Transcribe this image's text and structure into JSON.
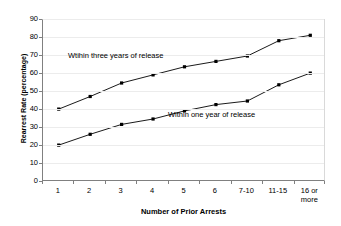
{
  "chart_data": {
    "type": "line",
    "title": "",
    "xlabel": "Number of Prior Arrests",
    "ylabel": "Rearrest Rate (percentage)",
    "categories": [
      "1",
      "2",
      "3",
      "4",
      "5",
      "6",
      "7-10",
      "11-15",
      "16 or\nmore"
    ],
    "ylim": [
      0,
      90
    ],
    "ytick_labels": [
      "90",
      "80",
      "70",
      "60",
      "50",
      "40",
      "30",
      "20",
      "10",
      "0"
    ],
    "ytick_values": [
      90,
      80,
      70,
      60,
      50,
      40,
      30,
      20,
      10,
      0
    ],
    "grid": true,
    "grid_axis": "y",
    "legend": "none",
    "marker": "square",
    "marker_color": "#000000",
    "line_color": "#000000",
    "series": [
      {
        "name": "Wtihin three years of release",
        "values": [
          40.5,
          47.5,
          55,
          59.5,
          64,
          67,
          70,
          78.5,
          81.5
        ]
      },
      {
        "name": "Within one year of release",
        "values": [
          20.5,
          26.5,
          32,
          35,
          39.5,
          43,
          45,
          54,
          60.5
        ]
      }
    ],
    "annotations": [
      {
        "text": "Wtihin three years of release",
        "series": "three-year"
      },
      {
        "text": "Within one year of release",
        "series": "one-year"
      }
    ]
  }
}
